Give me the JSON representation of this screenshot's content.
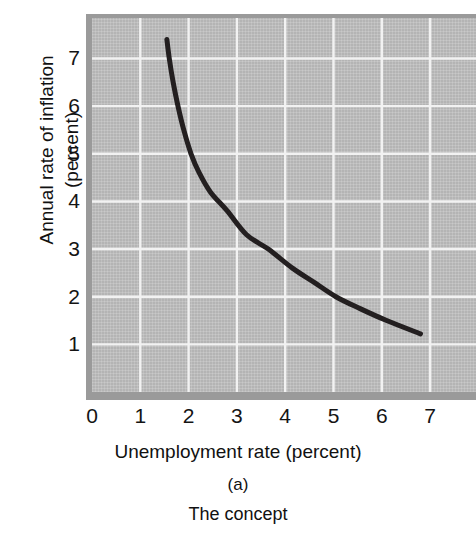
{
  "figure": {
    "panel_id": "(a)",
    "caption": "The concept"
  },
  "colors": {
    "plot_background": "#b4b4b4",
    "plot_border": "#9a9a9a",
    "gridline": "#f2f2f2",
    "curve": "#231f20",
    "text": "#141414",
    "page_background": "#ffffff"
  },
  "chart_data": {
    "type": "line",
    "title": "",
    "subtitle": "",
    "xlabel": "Unemployment rate (percent)",
    "ylabel": "Annual rate of inflation\n(percent)",
    "ylabel_lines": [
      "Annual rate of inflation",
      "(percent)"
    ],
    "xlim": [
      0,
      7.95
    ],
    "ylim": [
      0,
      7.85
    ],
    "xticks": [
      0,
      1,
      2,
      3,
      4,
      5,
      6,
      7
    ],
    "xticklabels": [
      "0",
      "1",
      "2",
      "3",
      "4",
      "5",
      "6",
      "7"
    ],
    "yticks": [
      1,
      2,
      3,
      4,
      5,
      6,
      7
    ],
    "yticklabels": [
      "1",
      "2",
      "3",
      "4",
      "5",
      "6",
      "7"
    ],
    "grid": true,
    "grid_axes": "both",
    "legend": null,
    "legend_position": "none",
    "annotations": [],
    "series": [
      {
        "name": "Phillips curve",
        "type": "line",
        "color": "#231f20",
        "linewidth": 5,
        "x": [
          1.55,
          1.6,
          1.68,
          1.78,
          1.9,
          2.05,
          2.22,
          2.45,
          2.8,
          3.2,
          3.65,
          4.15,
          4.6,
          5.05,
          5.55,
          6.1,
          6.8
        ],
        "y": [
          7.4,
          7.0,
          6.5,
          6.0,
          5.5,
          5.0,
          4.6,
          4.2,
          3.8,
          3.3,
          3.0,
          2.6,
          2.3,
          2.0,
          1.75,
          1.5,
          1.22
        ]
      }
    ]
  }
}
